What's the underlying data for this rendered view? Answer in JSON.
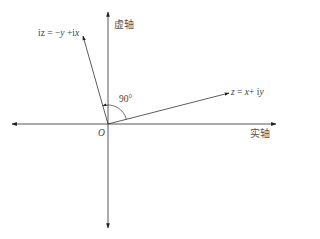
{
  "diagram": {
    "type": "complex-plane-rotation",
    "axes": {
      "imaginary_axis_label": "虚轴",
      "real_axis_label": "实轴",
      "origin_label": "O"
    },
    "vectors": [
      {
        "name": "z",
        "label": "z = x+ iy",
        "label_parts": [
          "z",
          " = ",
          "x",
          "+ i",
          "y"
        ]
      },
      {
        "name": "iz",
        "label": "iz = −y +ix",
        "label_parts": [
          "iz",
          " = −",
          "y",
          " +i",
          "x"
        ]
      }
    ],
    "angle": {
      "label": "90°",
      "between": [
        "z",
        "iz"
      ]
    },
    "colors": {
      "stroke": "#333333",
      "text": "#444444",
      "background": "#ffffff"
    }
  }
}
